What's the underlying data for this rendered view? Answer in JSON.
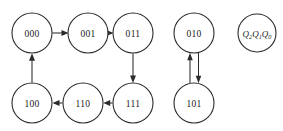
{
  "diagram": {
    "type": "state-transition-diagram",
    "title": "",
    "canvas": {
      "width": 283,
      "height": 131,
      "background": "#ffffff"
    },
    "style": {
      "stroke_color": "#2b2b2b",
      "fill_color": "#ffffff",
      "text_color": "#1a1a1a",
      "circle_radius": 20,
      "legend_circle_radius": 19
    },
    "legend": {
      "id": "legend",
      "q2": "Q",
      "q2_sub": "2",
      "q1": "Q",
      "q1_sub": "1",
      "q0": "Q",
      "q0_sub": "0",
      "full_text": "Q2Q1Q0",
      "cx": 257,
      "cy": 33,
      "r": 19
    },
    "nodes": [
      {
        "id": "s000",
        "label": "000",
        "cx": 32,
        "cy": 33,
        "r": 20
      },
      {
        "id": "s001",
        "label": "001",
        "cx": 88,
        "cy": 33,
        "r": 20
      },
      {
        "id": "s011",
        "label": "011",
        "cx": 133,
        "cy": 33,
        "r": 20
      },
      {
        "id": "s100",
        "label": "100",
        "cx": 32,
        "cy": 103,
        "r": 20
      },
      {
        "id": "s110",
        "label": "110",
        "cx": 83,
        "cy": 103,
        "r": 20
      },
      {
        "id": "s111",
        "label": "111",
        "cx": 133,
        "cy": 103,
        "r": 20
      },
      {
        "id": "s010",
        "label": "010",
        "cx": 194,
        "cy": 33,
        "r": 20
      },
      {
        "id": "s101",
        "label": "101",
        "cx": 194,
        "cy": 103,
        "r": 20
      }
    ],
    "edges": [
      {
        "id": "e-000-001",
        "from": "000",
        "to": "001",
        "direction": "right"
      },
      {
        "id": "e-001-011",
        "from": "001",
        "to": "011",
        "direction": "right"
      },
      {
        "id": "e-011-111",
        "from": "011",
        "to": "111",
        "direction": "down"
      },
      {
        "id": "e-111-110",
        "from": "111",
        "to": "110",
        "direction": "left"
      },
      {
        "id": "e-110-100",
        "from": "110",
        "to": "100",
        "direction": "left"
      },
      {
        "id": "e-100-000",
        "from": "100",
        "to": "000",
        "direction": "up"
      },
      {
        "id": "e-101-010",
        "from": "101",
        "to": "010",
        "direction": "up"
      },
      {
        "id": "e-010-101",
        "from": "010",
        "to": "101",
        "direction": "down"
      }
    ],
    "cycles": [
      [
        "000",
        "001",
        "011",
        "111",
        "110",
        "100",
        "000"
      ],
      [
        "010",
        "101",
        "010"
      ]
    ]
  }
}
